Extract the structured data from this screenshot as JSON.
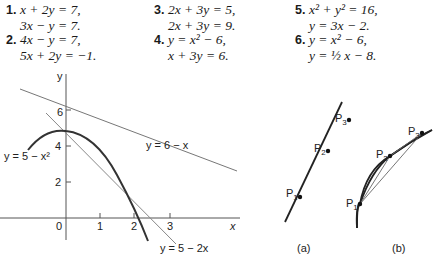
{
  "exercises": [
    {
      "number": "1.",
      "line1": "x + 2y = 7,",
      "line2": "3x − y = 7."
    },
    {
      "number": "2.",
      "line1": "4x − y = 7,",
      "line2": "5x + 2y = −1."
    },
    {
      "number": "3.",
      "line1": "2x + 3y = 5,",
      "line2": "2x + 3y = 9."
    },
    {
      "number": "4.",
      "line1": "y = x² − 6,",
      "line2": "x + 3y = 6."
    },
    {
      "number": "5.",
      "line1": "x² + y² = 16,",
      "line2": "y = 3x − 2."
    },
    {
      "number": "6.",
      "line1": "y = x² − 6,",
      "line2": "y = ½ x − 8."
    }
  ],
  "graph": {
    "y_axis_label": "y",
    "x_axis_label": "x",
    "origin_label": "0",
    "x_ticks": [
      "1",
      "2",
      "3"
    ],
    "y_ticks": [
      "2",
      "4",
      "6"
    ],
    "curve_labels": {
      "line_6_minus_x": "y = 6 − x",
      "line_5_minus_2x": "y = 5 − 2x",
      "parabola": "y = 5 − x²"
    }
  },
  "figure_a": {
    "caption": "(a)",
    "points": [
      "P1",
      "P2",
      "P3"
    ]
  },
  "figure_b": {
    "caption": "(b)",
    "points": [
      "P1",
      "P2",
      "P3"
    ]
  }
}
